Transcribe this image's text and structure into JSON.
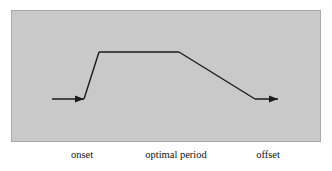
{
  "figure": {
    "panel": {
      "name": "diagram-panel",
      "fill_color": "#c9c9c9",
      "border_color": "#a8a8a8"
    },
    "curve": {
      "name": "trapezoid-response-curve",
      "stroke_color": "#1a1a1a",
      "stroke_width": 1.4,
      "description": "baseline, steep rise, plateau, gradual decline, baseline",
      "points": [
        {
          "x": 52,
          "y": 99
        },
        {
          "x": 84,
          "y": 99
        },
        {
          "x": 99,
          "y": 52
        },
        {
          "x": 179,
          "y": 52
        },
        {
          "x": 255,
          "y": 99
        },
        {
          "x": 278,
          "y": 99
        }
      ]
    },
    "arrows": {
      "entry": {
        "name": "entry-arrowhead",
        "tip_x": 84,
        "tip_y": 99,
        "direction": "right"
      },
      "exit": {
        "name": "exit-arrowhead",
        "tip_x": 278,
        "tip_y": 99,
        "direction": "right"
      }
    },
    "labels": {
      "onset": "onset",
      "optimal_period": "optimal period",
      "offset": "offset"
    }
  },
  "chart_data": {
    "type": "line",
    "title": "",
    "xlabel": "",
    "ylabel": "",
    "categories": [
      "onset",
      "optimal period",
      "offset"
    ],
    "annotations": [
      "onset",
      "optimal period",
      "offset"
    ],
    "grid": false,
    "legend": "none",
    "series": [
      {
        "name": "response level",
        "x": [
          0,
          10,
          15,
          41,
          66,
          73
        ],
        "values": [
          0,
          0,
          100,
          100,
          0,
          0
        ]
      }
    ],
    "xlim": [
      0,
      73
    ],
    "ylim": [
      0,
      100
    ]
  }
}
